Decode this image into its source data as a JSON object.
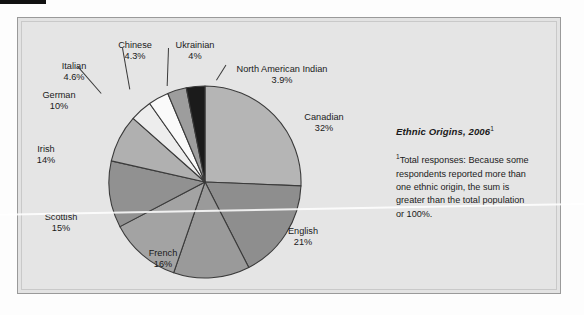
{
  "figure": {
    "caption_title": "Ethnic Origins, 2006",
    "caption_title_superscript": "1",
    "caption_note_superscript": "1",
    "caption_note": "Total responses: Because some respondents reported more than one ethnic origin, the sum is greater than the total population or 100%."
  },
  "chart_data": {
    "type": "pie",
    "title": "Ethnic Origins, 2006",
    "xlabel": "",
    "ylabel": "",
    "units": "percent",
    "legend_position": "labels-with-leader-lines",
    "grid": false,
    "note": "Total responses: Because some respondents reported more than one ethnic origin, the sum is greater than the total population or 100%.",
    "categories": [
      "Canadian",
      "English",
      "French",
      "Scottish",
      "Irish",
      "German",
      "Italian",
      "Chinese",
      "Ukrainian",
      "North American Indian"
    ],
    "values": [
      32,
      21,
      16,
      15,
      14,
      10,
      4.6,
      4.3,
      4,
      3.9
    ],
    "labels": [
      {
        "name": "Canadian",
        "value": 32,
        "value_text": "32%",
        "color": "#b5b5b5"
      },
      {
        "name": "English",
        "value": 21,
        "value_text": "21%",
        "color": "#8e8e8e"
      },
      {
        "name": "French",
        "value": 16,
        "value_text": "16%",
        "color": "#9a9a9a"
      },
      {
        "name": "Scottish",
        "value": 15,
        "value_text": "15%",
        "color": "#a3a3a3"
      },
      {
        "name": "Irish",
        "value": 14,
        "value_text": "14%",
        "color": "#919191"
      },
      {
        "name": "German",
        "value": 10,
        "value_text": "10%",
        "color": "#b0b0b0"
      },
      {
        "name": "Italian",
        "value": 4.6,
        "value_text": "4.6%",
        "color": "#ededed"
      },
      {
        "name": "Chinese",
        "value": 4.3,
        "value_text": "4.3%",
        "color": "#fafafa"
      },
      {
        "name": "Ukrainian",
        "value": 4,
        "value_text": "4%",
        "color": "#9d9d9d"
      },
      {
        "name": "North American Indian",
        "value": 3.9,
        "value_text": "3.9%",
        "color": "#1b1b1b"
      }
    ],
    "colors": {
      "panel_background": "#e5e5e5",
      "slice_outline": "#3a3a3a",
      "text": "#1a1a1a"
    }
  }
}
